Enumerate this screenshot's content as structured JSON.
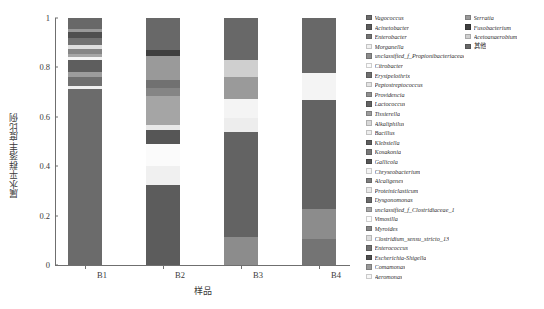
{
  "axes": {
    "ylabel": "属水平群落丰度比例",
    "xlabel": "样品",
    "yticks": [
      "0",
      "0.2",
      "0.4",
      "0.6",
      "0.8",
      "1"
    ],
    "ylim": [
      0,
      1
    ],
    "xticks": [
      "B1",
      "B2",
      "B3",
      "B4"
    ]
  },
  "chart_data": {
    "type": "bar",
    "title": "",
    "xlabel": "样品",
    "ylabel": "属水平群落丰度比例",
    "ylim": [
      0,
      1
    ],
    "grid": false,
    "stacked": true,
    "normalized": true,
    "legend_position": "right",
    "categories": [
      "B1",
      "B2",
      "B3",
      "B4"
    ],
    "series": [
      {
        "name": "Vagococcus",
        "color": "#6b6b6b",
        "values": [
          0.712,
          0.0,
          0.0,
          0.0
        ]
      },
      {
        "name": "Acinetobacter",
        "color": "#5c5c5c",
        "values": [
          0.0,
          0.322,
          0.0,
          0.0
        ]
      },
      {
        "name": "Enterobacter",
        "color": "#747474",
        "values": [
          0.0,
          0.0,
          0.0,
          0.106
        ]
      },
      {
        "name": "Morganella",
        "color": "#f0f0f0",
        "values": [
          0.014,
          0.078,
          0.0,
          0.0
        ]
      },
      {
        "name": "unclassified_f_Propionibacteriaceae",
        "color": "#8c8c8c",
        "values": [
          0.0,
          0.0,
          0.112,
          0.121
        ]
      },
      {
        "name": "Citrobacter",
        "color": "#fbfbfb",
        "values": [
          0.0,
          0.089,
          0.0,
          0.0
        ]
      },
      {
        "name": "Erysipelothrix",
        "color": "#6f6f6f",
        "values": [
          0.036,
          0.0,
          0.0,
          0.0
        ]
      },
      {
        "name": "Peptostreptococcus",
        "color": "#e3e3e3",
        "values": [
          0.0,
          0.0,
          0.0,
          0.0
        ]
      },
      {
        "name": "Providencia",
        "color": "#8f8f8f",
        "values": [
          0.0,
          0.0,
          0.0,
          0.0
        ]
      },
      {
        "name": "Lactococcus",
        "color": "#636363",
        "values": [
          0.0,
          0.0,
          0.425,
          0.443
        ]
      },
      {
        "name": "Tissierella",
        "color": "#9c9c9c",
        "values": [
          0.018,
          0.0,
          0.0,
          0.0
        ]
      },
      {
        "name": "Alkaliphilus",
        "color": "#d8d8d8",
        "values": [
          0.0,
          0.0,
          0.0,
          0.0
        ]
      },
      {
        "name": "Bacillus",
        "color": "#ededed",
        "values": [
          0.0,
          0.0,
          0.06,
          0.0
        ]
      },
      {
        "name": "Klebsiella",
        "color": "#5e5e5e",
        "values": [
          0.052,
          0.0,
          0.0,
          0.0
        ]
      },
      {
        "name": "Kosakonia",
        "color": "#787878",
        "values": [
          0.0,
          0.0,
          0.0,
          0.0
        ]
      },
      {
        "name": "Gallicola",
        "color": "#565656",
        "values": [
          0.0,
          0.057,
          0.0,
          0.0
        ]
      },
      {
        "name": "Chryseobacterium",
        "color": "#f4f4f4",
        "values": [
          0.01,
          0.0,
          0.076,
          0.108
        ]
      },
      {
        "name": "Alcaligenes",
        "color": "#7d7d7d",
        "values": [
          0.0,
          0.0,
          0.0,
          0.0
        ]
      },
      {
        "name": "Proteiniclasticum",
        "color": "#e8e8e8",
        "values": [
          0.0,
          0.022,
          0.0,
          0.0
        ]
      },
      {
        "name": "Dysgonomonas",
        "color": "#6a6a6a",
        "values": [
          0.0,
          0.0,
          0.0,
          0.0
        ]
      },
      {
        "name": "unclassified_f_Clostridiaceae_1",
        "color": "#a5a5a5",
        "values": [
          0.014,
          0.118,
          0.0,
          0.0
        ]
      },
      {
        "name": "Vimosilla",
        "color": "#fdfdfd",
        "values": [
          0.0,
          0.0,
          0.0,
          0.0
        ]
      },
      {
        "name": "Myroides",
        "color": "#858585",
        "values": [
          0.02,
          0.029,
          0.0,
          0.0
        ]
      },
      {
        "name": "Clostridium_sensu_stricto_13",
        "color": "#dedede",
        "values": [
          0.016,
          0.0,
          0.0,
          0.0
        ]
      },
      {
        "name": "Enterococcus",
        "color": "#717171",
        "values": [
          0.029,
          0.034,
          0.0,
          0.0
        ]
      },
      {
        "name": "Escherichia-Shigella",
        "color": "#4f4f4f",
        "values": [
          0.021,
          0.0,
          0.0,
          0.0
        ]
      },
      {
        "name": "Comamonas",
        "color": "#999999",
        "values": [
          0.012,
          0.042,
          0.0,
          0.0
        ]
      },
      {
        "name": "Aeromonas",
        "color": "#f7f7f7",
        "values": [
          0.0,
          0.0,
          0.0,
          0.0
        ]
      },
      {
        "name": "Serratia",
        "color": "#9a9a9a",
        "values": [
          0.0,
          0.055,
          0.088,
          0.0
        ]
      },
      {
        "name": "Fusobacterium",
        "color": "#3f3f3f",
        "values": [
          0.0,
          0.024,
          0.0,
          0.0
        ]
      },
      {
        "name": "Acetoanaerobium",
        "color": "#cfcfcf",
        "values": [
          0.0,
          0.0,
          0.071,
          0.0
        ]
      },
      {
        "name": "其他",
        "color": "#686868",
        "values": [
          0.046,
          0.13,
          0.168,
          0.222
        ]
      }
    ]
  },
  "legend": {
    "col1": [
      {
        "label": "Vagococcus",
        "color": "#6b6b6b",
        "cjk": false
      },
      {
        "label": "Acinetobacter",
        "color": "#5c5c5c",
        "cjk": false
      },
      {
        "label": "Enterobacter",
        "color": "#747474",
        "cjk": false
      },
      {
        "label": "Morganella",
        "color": "#f0f0f0",
        "cjk": false
      },
      {
        "label": "unclassified_f_Propionibacteriaceae",
        "color": "#8c8c8c",
        "cjk": false
      },
      {
        "label": "Citrobacter",
        "color": "#fbfbfb",
        "cjk": false
      },
      {
        "label": "Erysipelothrix",
        "color": "#6f6f6f",
        "cjk": false
      },
      {
        "label": "Peptostreptococcus",
        "color": "#e3e3e3",
        "cjk": false
      },
      {
        "label": "Providencia",
        "color": "#8f8f8f",
        "cjk": false
      },
      {
        "label": "Lactococcus",
        "color": "#636363",
        "cjk": false
      },
      {
        "label": "Tissierella",
        "color": "#9c9c9c",
        "cjk": false
      },
      {
        "label": "Alkaliphilus",
        "color": "#d8d8d8",
        "cjk": false
      },
      {
        "label": "Bacillus",
        "color": "#ededed",
        "cjk": false
      },
      {
        "label": "Klebsiella",
        "color": "#5e5e5e",
        "cjk": false
      },
      {
        "label": "Kosakonia",
        "color": "#787878",
        "cjk": false
      },
      {
        "label": "Gallicola",
        "color": "#565656",
        "cjk": false
      },
      {
        "label": "Chryseobacterium",
        "color": "#f4f4f4",
        "cjk": false
      },
      {
        "label": "Alcaligenes",
        "color": "#7d7d7d",
        "cjk": false
      },
      {
        "label": "Proteiniclasticum",
        "color": "#e8e8e8",
        "cjk": false
      },
      {
        "label": "Dysgonomonas",
        "color": "#6a6a6a",
        "cjk": false
      },
      {
        "label": "unclassified_f_Clostridiaceae_1",
        "color": "#a5a5a5",
        "cjk": false
      },
      {
        "label": "Vimosilla",
        "color": "#fdfdfd",
        "cjk": false
      },
      {
        "label": "Myroides",
        "color": "#858585",
        "cjk": false
      },
      {
        "label": "Clostridium_sensu_stricto_13",
        "color": "#dedede",
        "cjk": false
      },
      {
        "label": "Enterococcus",
        "color": "#717171",
        "cjk": false
      },
      {
        "label": "Escherichia-Shigella",
        "color": "#4f4f4f",
        "cjk": false
      },
      {
        "label": "Comamonas",
        "color": "#999999",
        "cjk": false
      },
      {
        "label": "Aeromonas",
        "color": "#f7f7f7",
        "cjk": false
      }
    ],
    "col2": [
      {
        "label": "Serratia",
        "color": "#9a9a9a",
        "cjk": false
      },
      {
        "label": "Fusobacterium",
        "color": "#3f3f3f",
        "cjk": false
      },
      {
        "label": "Acetoanaerobium",
        "color": "#cfcfcf",
        "cjk": false
      },
      {
        "label": "其他",
        "color": "#686868",
        "cjk": true
      }
    ]
  }
}
